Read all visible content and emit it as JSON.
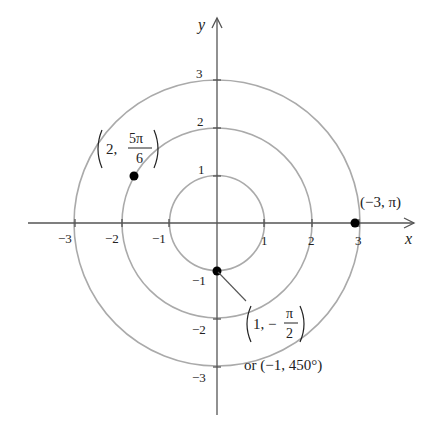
{
  "figure": {
    "type": "polar-coordinate-diagram",
    "axes": {
      "x_label": "x",
      "y_label": "y",
      "x_ticks": [
        "−3",
        "−2",
        "−1",
        "1",
        "2",
        "3"
      ],
      "y_ticks": [
        "3",
        "2",
        "1",
        "−1",
        "−2",
        "−3"
      ]
    },
    "circles_radii": [
      1,
      2,
      3
    ],
    "points": [
      {
        "id": "p1",
        "r": 2,
        "theta": "5π/6",
        "label_open": "(",
        "label_r": "2,",
        "label_num": "5π",
        "label_den": "6",
        "label_close": ")"
      },
      {
        "id": "p2",
        "r": -3,
        "theta": "π",
        "label": "(−3, π)"
      },
      {
        "id": "p3",
        "r": 1,
        "theta": "−π/2",
        "label_r": "1, −",
        "label_num": "π",
        "label_den": "2",
        "alt_label": "or (−1, 450°)"
      }
    ]
  },
  "colors": {
    "axis": "#555555",
    "circle": "#aaaaaa",
    "point": "#000000",
    "text": "#222222"
  }
}
